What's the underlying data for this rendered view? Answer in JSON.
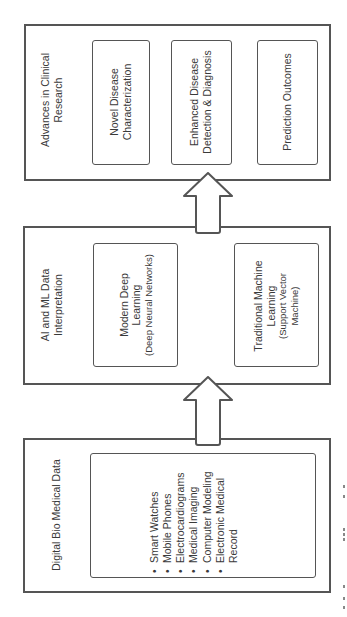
{
  "diagram": {
    "orientation": "rotated-90-ccw",
    "flow_direction": "bottom-to-top",
    "stages": [
      {
        "id": "digital-bio-medical-data",
        "title": "Digital Bio Medical Data",
        "items": [
          "Smart Watches",
          "Mobile Phones",
          "Electrocardiograms",
          "Medical Imaging",
          "Computer Modeling",
          "Electronic Medical",
          "Record"
        ]
      },
      {
        "id": "ai-ml-data-interpretation",
        "title_line1": "AI and ML Data",
        "title_line2": "Interpretation",
        "boxes": [
          {
            "line1": "Modern Deep",
            "line2": "Learning",
            "line3": "(Deep Neural Networks)"
          },
          {
            "line1": "Traditional Machine",
            "line2": "Learning",
            "line3": "(Support Vector",
            "line4": "Machine)"
          }
        ]
      },
      {
        "id": "advances-in-clinical-research",
        "title_line1": "Advances in Clinical",
        "title_line2": "Research",
        "boxes": [
          {
            "line1": "Novel Disease",
            "line2": "Characterization"
          },
          {
            "line1": "Enhanced Disease",
            "line2": "Detection & Diagnosis"
          },
          {
            "line1": "Prediction Outcomes"
          }
        ]
      }
    ],
    "arrows": [
      {
        "from": "digital-bio-medical-data",
        "to": "ai-ml-data-interpretation",
        "icon": "up-arrow-icon"
      },
      {
        "from": "ai-ml-data-interpretation",
        "to": "advances-in-clinical-research",
        "icon": "up-arrow-icon"
      }
    ],
    "colors": {
      "stroke": "#555555",
      "text": "#3a3a3a",
      "background": "#ffffff"
    }
  }
}
